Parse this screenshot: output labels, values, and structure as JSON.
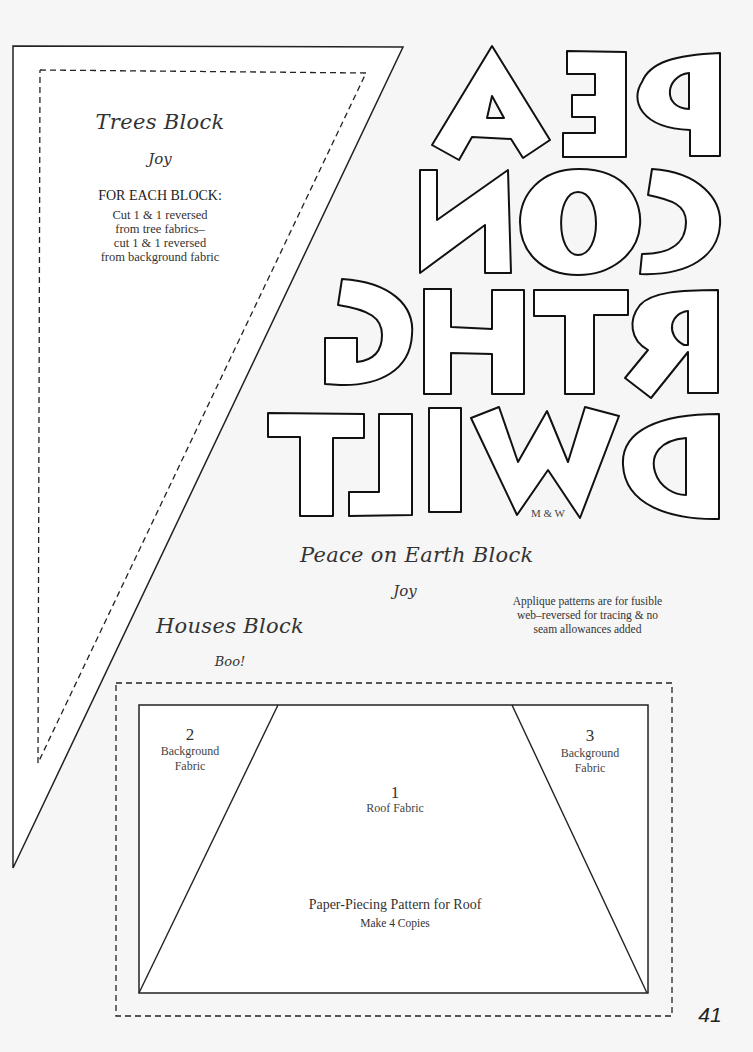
{
  "page": {
    "page_number": "41",
    "background": "#f6f6f6"
  },
  "trees_block": {
    "title": "Trees Block",
    "designer": "Joy",
    "instructions_heading": "FOR EACH BLOCK:",
    "instructions": [
      "Cut 1 & 1 reversed",
      "from tree fabrics–",
      "cut 1 & 1 reversed",
      "from background fabric"
    ]
  },
  "peace_on_earth_block": {
    "title": "Peace on Earth Block",
    "designer": "Joy",
    "applique_letters_rows": [
      "PE A",
      "CON",
      "RTHG",
      "DWILT"
    ],
    "letters_credit": "M & W",
    "note": [
      "Applique patterns are for fusible",
      "web–reversed for tracing & no",
      "seam allowances added"
    ]
  },
  "houses_block": {
    "title": "Houses Block",
    "designer": "Boo!",
    "pieces": [
      {
        "number": "2",
        "label_line1": "Background",
        "label_line2": "Fabric"
      },
      {
        "number": "1",
        "label_line1": "Roof Fabric",
        "label_line2": ""
      },
      {
        "number": "3",
        "label_line1": "Background",
        "label_line2": "Fabric"
      }
    ],
    "pattern_title": "Paper-Piecing Pattern for Roof",
    "pattern_note": "Make 4 Copies"
  }
}
